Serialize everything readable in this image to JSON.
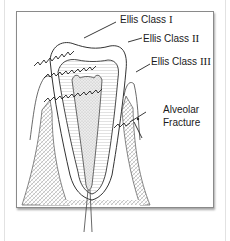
{
  "diagram": {
    "type": "dental-fracture-classification",
    "labels": {
      "class1": {
        "text": "Ellis Class",
        "numeral": "I"
      },
      "class2": {
        "text": "Ellis Class",
        "numeral": "II"
      },
      "class3": {
        "text": "Ellis Class",
        "numeral": "III"
      },
      "alveolar_line1": "Alveolar",
      "alveolar_line2": "Fracture"
    },
    "colors": {
      "line": "#333333",
      "frame": "#8a8a8a",
      "bone_stipple": "#9a9a9a",
      "background": "#ffffff"
    }
  }
}
